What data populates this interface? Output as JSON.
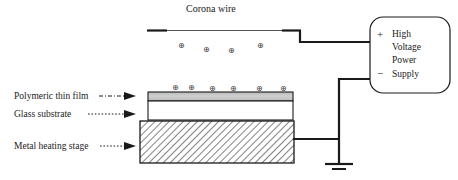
{
  "diagram": {
    "title": "Corona wire",
    "type": "corona-poling-apparatus-schematic",
    "background_color": "#ffffff",
    "line_color": "#1a1a1a"
  },
  "labels": {
    "polymeric_thin_film": "Polymeric thin film",
    "glass_substrate": "Glass substrate",
    "metal_heating_stage": "Metal heating stage"
  },
  "power_supply": {
    "lines": [
      "High",
      "Voltage",
      "Power",
      "Supply"
    ],
    "terminal_positive": "+",
    "terminal_negative": "−"
  },
  "charges": {
    "symbol": "⊕",
    "upper_group": [
      {
        "x": 178,
        "y": 42
      },
      {
        "x": 203,
        "y": 46
      },
      {
        "x": 228,
        "y": 47
      },
      {
        "x": 257,
        "y": 42
      }
    ],
    "lower_group": [
      {
        "x": 172,
        "y": 84
      },
      {
        "x": 188,
        "y": 84
      },
      {
        "x": 209,
        "y": 85
      },
      {
        "x": 230,
        "y": 85
      },
      {
        "x": 256,
        "y": 85
      },
      {
        "x": 280,
        "y": 85
      }
    ]
  },
  "layers": {
    "film": {
      "fill": "#c9c9c9",
      "stroke": "#1a1a1a"
    },
    "glass": {
      "fill": "#ffffff",
      "stroke": "#1a1a1a"
    },
    "metal": {
      "fill": "#ffffff",
      "stroke": "#1a1a1a",
      "pattern": "diagonal-hatch"
    }
  }
}
